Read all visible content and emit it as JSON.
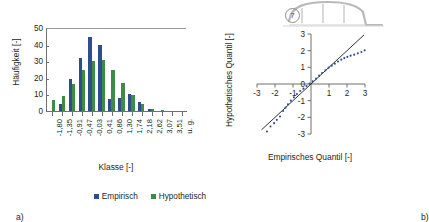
{
  "figure": {
    "caption_a": "a)",
    "caption_b": "b)"
  },
  "bridge_icon": {
    "name": "bridge-cross-section-icon",
    "number_label": "7"
  },
  "legend": {
    "items": [
      {
        "label": "Empirisch",
        "color": "#2e4d8f"
      },
      {
        "label": "Hypothetisch",
        "color": "#3f8a45"
      }
    ]
  },
  "chart_data": [
    {
      "type": "bar",
      "id": "histogram",
      "title": "",
      "xlabel": "Klasse [-]",
      "ylabel": "Häufigkeit [-]",
      "ylim": [
        0,
        50
      ],
      "yticks": [
        0,
        10,
        20,
        30,
        40,
        50
      ],
      "grid": false,
      "legend_position": "bottom",
      "categories": [
        "-1,80",
        "-1,35",
        "-0,91",
        "-0,47",
        "-0,03",
        "0,41",
        "0,86",
        "1,30",
        "1,74",
        "2,18",
        "2,62",
        "3,07",
        "3,51",
        "u. g."
      ],
      "series": [
        {
          "name": "Empirisch",
          "color": "#2e4d8f",
          "values": [
            0,
            4,
            19,
            32,
            44.5,
            40,
            7,
            8,
            10,
            5.5,
            1,
            0,
            0,
            0
          ]
        },
        {
          "name": "Hypothetisch",
          "color": "#3f8a45",
          "values": [
            6.5,
            9,
            16,
            24.5,
            30,
            30.5,
            25,
            17,
            9.5,
            4,
            1.5,
            0.5,
            0,
            0
          ]
        }
      ]
    },
    {
      "type": "scatter",
      "id": "qq-plot",
      "title": "",
      "xlabel": "Empirisches Quantil [-]",
      "ylabel": "Hypothetisches Quantil [-]",
      "xlim": [
        -3,
        3
      ],
      "ylim": [
        -3,
        3
      ],
      "xticks": [
        "-3",
        "-2",
        "-1",
        "0",
        "1",
        "2",
        "3"
      ],
      "yticks": [
        "-3",
        "-2",
        "-1",
        "0",
        "1",
        "2",
        "3"
      ],
      "grid": false,
      "reference_line": {
        "label": "1:1 line",
        "slope": 1,
        "intercept": 0,
        "color": "#1a1a1a"
      },
      "point_color": "#2e4d8f",
      "points": [
        [
          -2.7,
          -3.05
        ],
        [
          -2.45,
          -2.85
        ],
        [
          -2.25,
          -2.55
        ],
        [
          -2.05,
          -2.35
        ],
        [
          -1.9,
          -2.15
        ],
        [
          -1.72,
          -1.95
        ],
        [
          -1.55,
          -1.62
        ],
        [
          -1.42,
          -1.42
        ],
        [
          -1.28,
          -1.22
        ],
        [
          -1.12,
          -1.0
        ],
        [
          -0.95,
          -0.8
        ],
        [
          -0.78,
          -0.6
        ],
        [
          -0.6,
          -0.42
        ],
        [
          -0.42,
          -0.28
        ],
        [
          -0.25,
          -0.12
        ],
        [
          -0.08,
          0.02
        ],
        [
          0.1,
          0.16
        ],
        [
          0.28,
          0.32
        ],
        [
          0.45,
          0.5
        ],
        [
          0.62,
          0.66
        ],
        [
          0.8,
          0.82
        ],
        [
          0.98,
          0.98
        ],
        [
          1.15,
          1.1
        ],
        [
          1.32,
          1.22
        ],
        [
          1.5,
          1.35
        ],
        [
          1.68,
          1.46
        ],
        [
          1.85,
          1.55
        ],
        [
          2.02,
          1.63
        ],
        [
          2.2,
          1.7
        ],
        [
          2.4,
          1.76
        ],
        [
          2.6,
          1.84
        ],
        [
          2.8,
          1.92
        ],
        [
          2.98,
          2.02
        ]
      ]
    }
  ]
}
